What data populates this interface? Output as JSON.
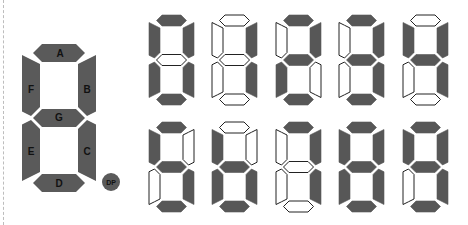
{
  "colors": {
    "segment_on": "#575757",
    "segment_off": "#ffffff",
    "outline": "#222222"
  },
  "reference_digit": {
    "segments": [
      {
        "id": "A",
        "label": "A"
      },
      {
        "id": "B",
        "label": "B"
      },
      {
        "id": "C",
        "label": "C"
      },
      {
        "id": "D",
        "label": "D"
      },
      {
        "id": "E",
        "label": "E"
      },
      {
        "id": "F",
        "label": "F"
      },
      {
        "id": "G",
        "label": "G"
      }
    ],
    "decimal_point": {
      "label": "DP"
    }
  },
  "digits": [
    {
      "value": 0,
      "on": [
        "A",
        "B",
        "C",
        "D",
        "E",
        "F"
      ]
    },
    {
      "value": 1,
      "on": [
        "B",
        "C"
      ]
    },
    {
      "value": 2,
      "on": [
        "A",
        "B",
        "D",
        "E",
        "G"
      ]
    },
    {
      "value": 3,
      "on": [
        "A",
        "B",
        "C",
        "D",
        "G"
      ]
    },
    {
      "value": 4,
      "on": [
        "B",
        "C",
        "F",
        "G"
      ]
    },
    {
      "value": 5,
      "on": [
        "A",
        "C",
        "D",
        "F",
        "G"
      ]
    },
    {
      "value": 6,
      "on": [
        "C",
        "D",
        "E",
        "F",
        "G"
      ]
    },
    {
      "value": 7,
      "on": [
        "A",
        "B",
        "C"
      ]
    },
    {
      "value": 8,
      "on": [
        "A",
        "B",
        "C",
        "D",
        "E",
        "F",
        "G"
      ]
    },
    {
      "value": 9,
      "on": [
        "A",
        "B",
        "C",
        "D",
        "F",
        "G"
      ]
    }
  ]
}
